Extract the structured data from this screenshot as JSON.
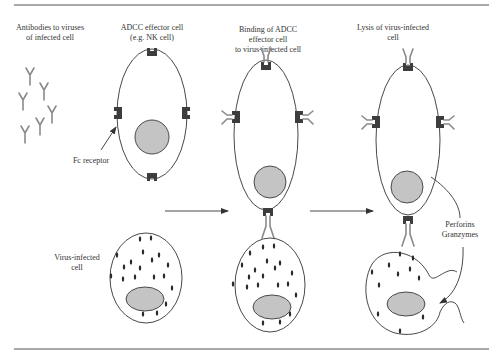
{
  "figure": {
    "panels": [
      {
        "id": "antibodies",
        "label_lines": [
          "Antibodies to viruses",
          "of infected cell"
        ]
      },
      {
        "id": "effector",
        "label_lines": [
          "ADCC effector cell",
          "(e.g. NK cell)"
        ]
      },
      {
        "id": "binding",
        "label_lines": [
          "Binding of ADCC",
          "effector cell",
          "to virus-infected cell"
        ]
      },
      {
        "id": "lysis",
        "label_lines": [
          "Lysis of virus-infected",
          "cell"
        ]
      }
    ],
    "annotations": {
      "fc_receptor": "Fc receptor",
      "virus_infected_lines": [
        "Virus-infected",
        "cell"
      ],
      "perforins": "Perforins",
      "granzymes": "Granzymes"
    },
    "colors": {
      "outline": "#333333",
      "nucleus": "#c4c4c4",
      "receptor": "#3d3d3d",
      "antibody": "#8a8a8a",
      "virus": "#2a2a2a"
    }
  }
}
